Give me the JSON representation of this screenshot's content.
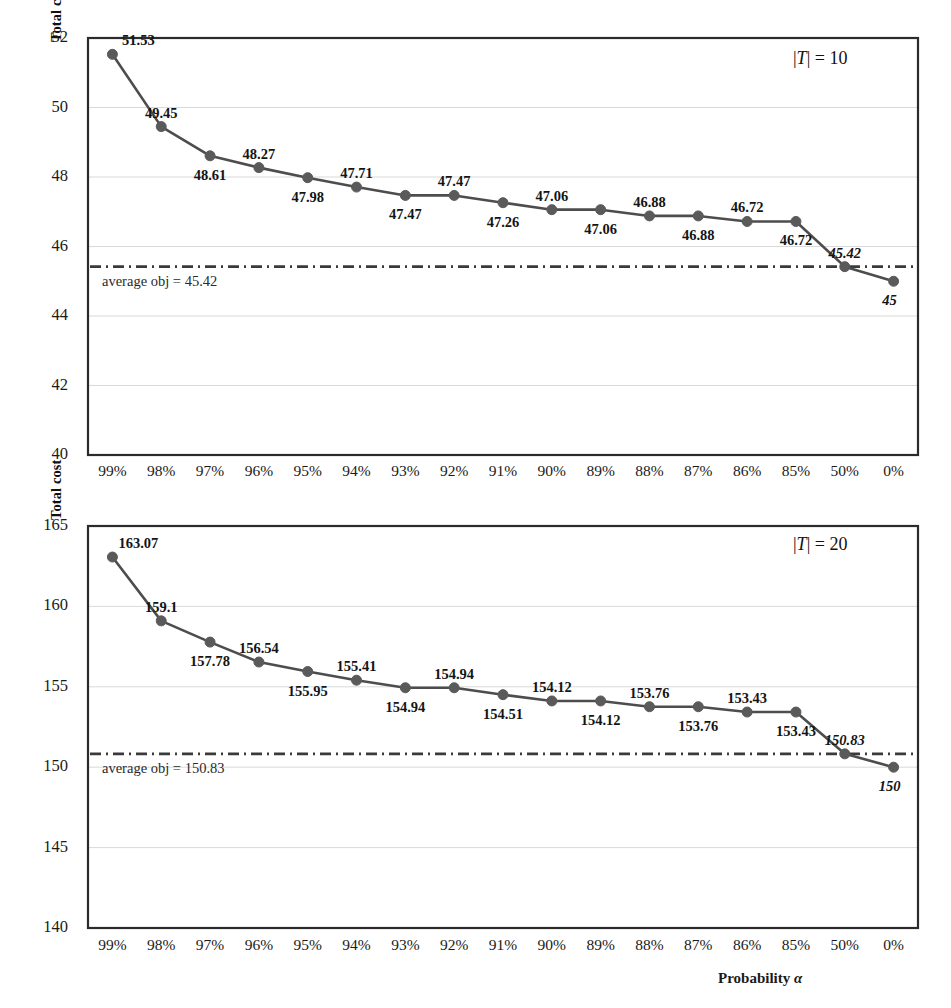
{
  "figure": {
    "background": "#ffffff",
    "line_color": "#4d4d4d",
    "marker_color": "#5a5a5a",
    "border_color": "#2b2b2b",
    "grid_color": "#d9d9d9",
    "avg_line_color": "#3a3a3a",
    "xaxis_title_prefix": "Probability ",
    "xaxis_title_symbol": "α"
  },
  "chart_data": [
    {
      "type": "line",
      "title": "",
      "annotation": "|T| = 10",
      "annotation_prefix": "|",
      "annotation_symbol": "T",
      "annotation_suffix": "| = 10",
      "xlabel": "Probability α",
      "ylabel": "Total cost",
      "categories": [
        "99%",
        "98%",
        "97%",
        "96%",
        "95%",
        "94%",
        "93%",
        "92%",
        "91%",
        "90%",
        "89%",
        "88%",
        "87%",
        "86%",
        "85%",
        "50%",
        "0%"
      ],
      "values": [
        51.53,
        49.45,
        48.61,
        48.27,
        47.98,
        47.71,
        47.47,
        47.47,
        47.26,
        47.06,
        47.06,
        46.88,
        46.88,
        46.72,
        46.72,
        45.42,
        45
      ],
      "point_labels": [
        "51.53",
        "49.45",
        "48.61",
        "48.27",
        "47.98",
        "47.71",
        "47.47",
        "47.47",
        "47.26",
        "47.06",
        "47.06",
        "46.88",
        "46.88",
        "46.72",
        "46.72",
        "45.42",
        "45"
      ],
      "label_positions": [
        "above",
        "above",
        "below",
        "above",
        "below",
        "above",
        "below",
        "above",
        "below",
        "above",
        "below",
        "above",
        "below",
        "above",
        "below",
        "above",
        "below"
      ],
      "label_emphasis": [
        false,
        false,
        false,
        false,
        false,
        false,
        false,
        false,
        false,
        false,
        false,
        false,
        false,
        false,
        false,
        true,
        true
      ],
      "ylim": [
        40,
        52
      ],
      "yticks": [
        "52",
        "50",
        "48",
        "46",
        "44",
        "42",
        "40"
      ],
      "ytick_values": [
        52,
        50,
        48,
        46,
        44,
        42,
        40
      ],
      "grid": true,
      "legend": "none",
      "average_line_value": 45.42,
      "average_line_label": "average obj = 45.42"
    },
    {
      "type": "line",
      "title": "",
      "annotation": "|T| = 20",
      "annotation_prefix": "|",
      "annotation_symbol": "T",
      "annotation_suffix": "| = 20",
      "xlabel": "Probability α",
      "ylabel": "Total cost",
      "categories": [
        "99%",
        "98%",
        "97%",
        "96%",
        "95%",
        "94%",
        "93%",
        "92%",
        "91%",
        "90%",
        "89%",
        "88%",
        "87%",
        "86%",
        "85%",
        "50%",
        "0%"
      ],
      "values": [
        163.07,
        159.1,
        157.78,
        156.54,
        155.95,
        155.41,
        154.94,
        154.94,
        154.51,
        154.12,
        154.12,
        153.76,
        153.76,
        153.43,
        153.43,
        150.83,
        150
      ],
      "point_labels": [
        "163.07",
        "159.1",
        "157.78",
        "156.54",
        "155.95",
        "155.41",
        "154.94",
        "154.94",
        "154.51",
        "154.12",
        "154.12",
        "153.76",
        "153.76",
        "153.43",
        "153.43",
        "150.83",
        "150"
      ],
      "label_positions": [
        "above",
        "above",
        "below",
        "above",
        "below",
        "above",
        "below",
        "above",
        "below",
        "above",
        "below",
        "above",
        "below",
        "above",
        "below",
        "above",
        "below"
      ],
      "label_emphasis": [
        false,
        false,
        false,
        false,
        false,
        false,
        false,
        false,
        false,
        false,
        false,
        false,
        false,
        false,
        false,
        true,
        true
      ],
      "ylim": [
        140,
        165
      ],
      "yticks": [
        "165",
        "160",
        "155",
        "150",
        "145",
        "140"
      ],
      "ytick_values": [
        165,
        160,
        155,
        150,
        145,
        140
      ],
      "grid": true,
      "legend": "none",
      "average_line_value": 150.83,
      "average_line_label": "average obj = 150.83"
    }
  ]
}
